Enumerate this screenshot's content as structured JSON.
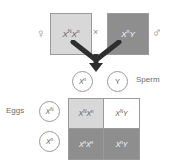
{
  "diagram": {
    "colors": {
      "light_gray": "#d8d8d8",
      "dark_gray": "#8e8e8e",
      "white": "#ffffff",
      "outline": "#9a9a9a",
      "text": "#5a5a5a"
    }
  },
  "parents": {
    "female": {
      "genotype": "XᴺXⁿ",
      "base": "X",
      "allele_1": "N",
      "allele_2": "n",
      "sex_symbol": "♀",
      "sex_symbol_name": "venus-symbol",
      "fill": "#d8d8d8"
    },
    "male": {
      "genotype": "XⁿY",
      "base": "X",
      "allele_1": "n",
      "allele_2": "Y",
      "sex_symbol": "♂",
      "sex_symbol_name": "mars-symbol",
      "fill": "#8e8e8e"
    },
    "cross_symbol": "×"
  },
  "gametes": {
    "sperm_label": "Sperm",
    "eggs_label": "Eggs",
    "sperm": [
      {
        "display": "Xⁿ",
        "base": "X",
        "sup": "n"
      },
      {
        "display": "Y",
        "base": "Y",
        "sup": ""
      }
    ],
    "eggs": [
      {
        "display": "Xᴺ",
        "base": "X",
        "sup": "N"
      },
      {
        "display": "Xⁿ",
        "base": "X",
        "sup": "n"
      }
    ]
  },
  "punnett": {
    "cells": [
      {
        "display": "XᴺXⁿ",
        "base_1": "X",
        "sup_1": "N",
        "base_2": "X",
        "sup_2": "n",
        "shade": "light"
      },
      {
        "display": "XᴺY",
        "base_1": "X",
        "sup_1": "N",
        "base_2": "Y",
        "sup_2": "",
        "shade": "white"
      },
      {
        "display": "XⁿXⁿ",
        "base_1": "X",
        "sup_1": "n",
        "base_2": "X",
        "sup_2": "n",
        "shade": "dark"
      },
      {
        "display": "XⁿY",
        "base_1": "X",
        "sup_1": "n",
        "base_2": "Y",
        "sup_2": "",
        "shade": "dark"
      }
    ]
  }
}
